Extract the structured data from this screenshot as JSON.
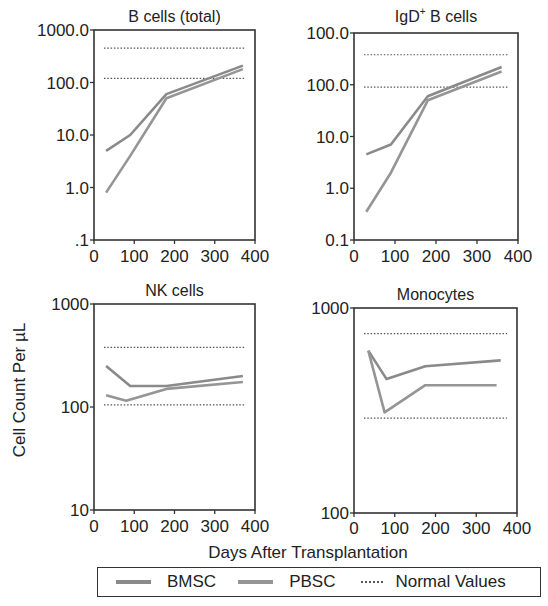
{
  "figure": {
    "y_axis_label": "Cell Count Per µL",
    "x_axis_label": "Days After Transplantation"
  },
  "legend": {
    "items": [
      {
        "label": "BMSC",
        "style": "solid",
        "color": "#8a8a8a"
      },
      {
        "label": "PBSC",
        "style": "solid",
        "color": "#959595"
      },
      {
        "label": "Normal Values",
        "style": "dotted",
        "color": "#555555"
      }
    ]
  },
  "chart_data": [
    {
      "type": "line",
      "title": "B cells (total)",
      "xlabel": "Days After Transplantation",
      "ylabel": "Cell Count Per µL",
      "yscale": "log",
      "ylim": [
        0.1,
        1000
      ],
      "xlim": [
        0,
        400
      ],
      "x_ticks": [
        "0",
        "100",
        "200",
        "300",
        "400"
      ],
      "y_ticks": [
        ".1",
        "1.0",
        "10.0",
        "100.0",
        "1000.0"
      ],
      "series": [
        {
          "name": "BMSC",
          "x": [
            30,
            90,
            180,
            370
          ],
          "values": [
            5,
            10,
            60,
            210
          ]
        },
        {
          "name": "PBSC",
          "x": [
            30,
            90,
            180,
            370
          ],
          "values": [
            0.8,
            4,
            50,
            180
          ]
        }
      ],
      "normal_values": [
        120,
        450
      ]
    },
    {
      "type": "line",
      "title": "IgD+ B cells",
      "title_main": "IgD",
      "title_sup": "+",
      "title_rest": " B cells",
      "xlabel": "Days After Transplantation",
      "ylabel": "Cell Count Per µL",
      "yscale": "log",
      "ylim": [
        0.1,
        1000
      ],
      "xlim": [
        0,
        400
      ],
      "x_ticks": [
        "0",
        "100",
        "200",
        "300",
        "400"
      ],
      "y_ticks": [
        "0.1",
        "1.0",
        "10.0",
        "100.0",
        "100.0"
      ],
      "series": [
        {
          "name": "BMSC",
          "x": [
            30,
            90,
            180,
            360
          ],
          "values": [
            4.5,
            7,
            60,
            220
          ]
        },
        {
          "name": "PBSC",
          "x": [
            30,
            90,
            180,
            360
          ],
          "values": [
            0.35,
            2,
            50,
            180
          ]
        }
      ],
      "normal_values": [
        90,
        380
      ]
    },
    {
      "type": "line",
      "title": "NK cells",
      "xlabel": "Days After Transplantation",
      "ylabel": "Cell Count Per µL",
      "yscale": "log",
      "ylim": [
        10,
        1000
      ],
      "xlim": [
        0,
        400
      ],
      "x_ticks": [
        "0",
        "100",
        "200",
        "300",
        "400"
      ],
      "y_ticks": [
        "10",
        "100",
        "1000"
      ],
      "series": [
        {
          "name": "BMSC",
          "x": [
            30,
            90,
            180,
            370
          ],
          "values": [
            250,
            160,
            160,
            200
          ]
        },
        {
          "name": "PBSC",
          "x": [
            30,
            80,
            180,
            370
          ],
          "values": [
            130,
            115,
            150,
            175
          ]
        }
      ],
      "normal_values": [
        105,
        380
      ]
    },
    {
      "type": "line",
      "title": "Monocytes",
      "xlabel": "Days After Transplantation",
      "ylabel": "Cell Count Per µL",
      "yscale": "log",
      "ylim": [
        100,
        1000
      ],
      "xlim": [
        0,
        400
      ],
      "x_ticks": [
        "0",
        "100",
        "200",
        "300",
        "400"
      ],
      "y_ticks": [
        "100",
        "1000"
      ],
      "series": [
        {
          "name": "BMSC",
          "x": [
            35,
            80,
            175,
            360
          ],
          "values": [
            620,
            450,
            520,
            555
          ]
        },
        {
          "name": "PBSC",
          "x": [
            35,
            75,
            175,
            350
          ],
          "values": [
            620,
            310,
            420,
            420
          ]
        }
      ],
      "normal_values": [
        290,
        750
      ]
    }
  ]
}
